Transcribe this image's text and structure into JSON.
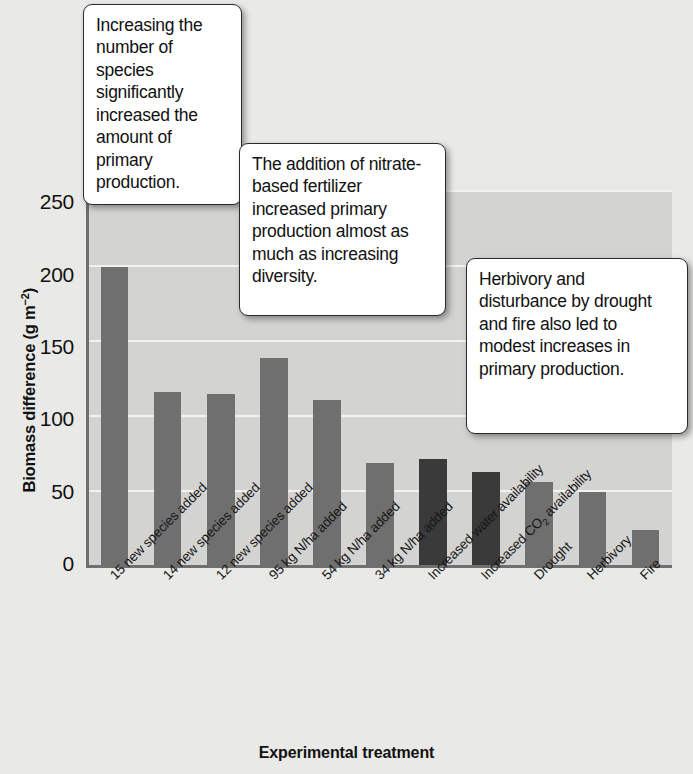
{
  "chart_data": {
    "type": "bar",
    "title": "",
    "xlabel": "Experimental treatment",
    "ylabel": "Biomass difference (g m⁻²)",
    "ylabel_main": "Biomass difference (g m",
    "ylabel_sup": "−2",
    "ylabel_tail": ")",
    "ylim": [
      0,
      260
    ],
    "yticks": [
      0,
      50,
      100,
      150,
      200,
      250
    ],
    "ytick_labels": [
      "0",
      "50",
      "100",
      "150",
      "200",
      "250"
    ],
    "grid": "horizontal-white",
    "legend": "none",
    "categories": [
      "15 new species added",
      "14 new species added",
      "12 new species added",
      "95 kg N/ha added",
      "54 kg N/ha added",
      "34 kg N/ha added",
      "Increased water availability",
      "Increased CO2 availability",
      "Drought",
      "Herbivory",
      "Fire"
    ],
    "values": [
      207,
      120,
      119,
      144,
      115,
      71,
      74,
      65,
      58,
      51,
      25
    ],
    "bar_colors": [
      "#6f6f6f",
      "#6f6f6f",
      "#6f6f6f",
      "#6f6f6f",
      "#6f6f6f",
      "#6f6f6f",
      "#3a3a3a",
      "#3a3a3a",
      "#6f6f6f",
      "#6f6f6f",
      "#6f6f6f"
    ],
    "colors": {
      "bar_light": "#6f6f6f",
      "bar_dark": "#3a3a3a",
      "plot_background": "#d3d3d2",
      "gridline": "#f2f2f0",
      "page_background": "#e9e9e7",
      "axis": "#6f6f6f",
      "text": "#111111"
    }
  },
  "axes": {
    "y_title_text": "Biomass difference (g m",
    "y_title_sup": "−2",
    "y_title_close": ")",
    "x_title": "Experimental treatment"
  },
  "xlabels": [
    {
      "text": "15 new species added",
      "sub": ""
    },
    {
      "text": "14 new species added",
      "sub": ""
    },
    {
      "text": "12 new species added",
      "sub": ""
    },
    {
      "text": "95 kg N/ha added",
      "sub": ""
    },
    {
      "text": "54 kg N/ha added",
      "sub": ""
    },
    {
      "text": "34 kg N/ha added",
      "sub": ""
    },
    {
      "text": "Increased water availability",
      "sub": ""
    },
    {
      "text": "Increased CO",
      "sub": "2",
      "tail": " availability"
    },
    {
      "text": "Drought",
      "sub": ""
    },
    {
      "text": "Herbivory",
      "sub": ""
    },
    {
      "text": "Fire",
      "sub": ""
    }
  ],
  "callouts": [
    {
      "id": "callout-1",
      "text": "Increasing the number of species significantly increased the amount of primary production."
    },
    {
      "id": "callout-2",
      "text": "The addition of nitrate-based fertilizer increased primary production almost as much as increasing diversity."
    },
    {
      "id": "callout-3",
      "text": "Herbivory and disturbance by drought and fire also led to modest increases in primary production."
    }
  ]
}
